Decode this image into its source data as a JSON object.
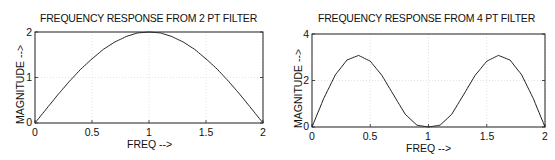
{
  "chart_data": [
    {
      "type": "line",
      "title": "FREQUENCY RESPONSE FROM 2 PT FILTER",
      "xlabel": "FREQ -->",
      "ylabel": "MAGNITUDE -->",
      "xlim": [
        0,
        2
      ],
      "ylim": [
        0,
        2
      ],
      "xticks": [
        "0",
        "0.5",
        "1",
        "1.5",
        "2"
      ],
      "yticks": [
        "0",
        "1",
        "2"
      ],
      "grid": true,
      "series": [
        {
          "name": "magnitude",
          "x": [
            0,
            0.1,
            0.2,
            0.3,
            0.4,
            0.5,
            0.6,
            0.7,
            0.8,
            0.9,
            1.0,
            1.1,
            1.2,
            1.3,
            1.4,
            1.5,
            1.6,
            1.7,
            1.8,
            1.9,
            2.0
          ],
          "y": [
            0,
            0.31,
            0.62,
            0.91,
            1.18,
            1.41,
            1.62,
            1.78,
            1.9,
            1.98,
            2.0,
            1.98,
            1.9,
            1.78,
            1.62,
            1.41,
            1.18,
            0.91,
            0.62,
            0.31,
            0
          ]
        }
      ]
    },
    {
      "type": "line",
      "title": "FREQUENCY RESPONSE FROM 4 PT FILTER",
      "xlabel": "FREQ -->",
      "ylabel": "MAGNITUDE -->",
      "xlim": [
        0,
        2
      ],
      "ylim": [
        0,
        4
      ],
      "xticks": [
        "0",
        "0.5",
        "1",
        "1.5",
        "2"
      ],
      "yticks": [
        "0",
        "2",
        "4"
      ],
      "grid": true,
      "series": [
        {
          "name": "magnitude",
          "x": [
            0,
            0.1,
            0.2,
            0.3,
            0.4,
            0.5,
            0.6,
            0.7,
            0.8,
            0.9,
            1.0,
            1.1,
            1.2,
            1.3,
            1.4,
            1.5,
            1.6,
            1.7,
            1.8,
            1.9,
            2.0
          ],
          "y": [
            0,
            1.22,
            2.24,
            2.88,
            3.08,
            2.83,
            2.22,
            1.38,
            0.55,
            0.08,
            0,
            0.08,
            0.55,
            1.38,
            2.22,
            2.83,
            3.08,
            2.88,
            2.24,
            1.22,
            0
          ]
        }
      ]
    }
  ],
  "charts": [
    {
      "title": "FREQUENCY RESPONSE FROM 2 PT FILTER",
      "xlabel": "FREQ -->",
      "ylabel": "MAGNITUDE -->",
      "xticks": [
        "0",
        "0.5",
        "1",
        "1.5",
        "2"
      ],
      "yticks": [
        "0",
        "1",
        "2"
      ]
    },
    {
      "title": "FREQUENCY RESPONSE FROM 4 PT FILTER",
      "xlabel": "FREQ -->",
      "ylabel": "MAGNITUDE -->",
      "xticks": [
        "0",
        "0.5",
        "1",
        "1.5",
        "2"
      ],
      "yticks": [
        "0",
        "2",
        "4"
      ]
    }
  ]
}
